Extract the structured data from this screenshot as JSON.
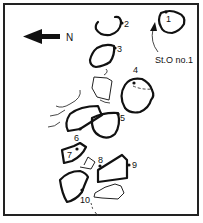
{
  "figure": {
    "type": "site plan of standing stones",
    "north_label": "N",
    "north_arrow_direction": "left",
    "annotation": "St.O no.1",
    "stones": [
      {
        "id": "1",
        "label": "1"
      },
      {
        "id": "2",
        "label": "2"
      },
      {
        "id": "3",
        "label": "3"
      },
      {
        "id": "4",
        "label": "4"
      },
      {
        "id": "5",
        "label": "5"
      },
      {
        "id": "6",
        "label": "6"
      },
      {
        "id": "7",
        "label": "7"
      },
      {
        "id": "8",
        "label": "8"
      },
      {
        "id": "9",
        "label": "9"
      },
      {
        "id": "10",
        "label": "10"
      }
    ],
    "colors": {
      "ink": "#111111",
      "background": "#ffffff"
    }
  }
}
